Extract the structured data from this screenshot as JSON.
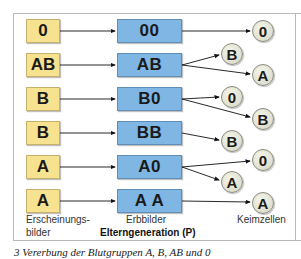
{
  "phenotypes": [
    "0",
    "AB",
    "B",
    "B",
    "A",
    "A"
  ],
  "genotypes": [
    "00",
    "AB",
    "B0",
    "BB",
    "A0",
    "A A"
  ],
  "gametes": [
    {
      "label": "0",
      "column": "right"
    },
    {
      "label": "B",
      "column": "left"
    },
    {
      "label": "A",
      "column": "right"
    },
    {
      "label": "0",
      "column": "left"
    },
    {
      "label": "B",
      "column": "right"
    },
    {
      "label": "B",
      "column": "left"
    },
    {
      "label": "0",
      "column": "right"
    },
    {
      "label": "A",
      "column": "left"
    },
    {
      "label": "A",
      "column": "right"
    }
  ],
  "labels": {
    "phenotype_line1": "Erscheinungs-",
    "phenotype_line2": "bilder",
    "genotype": "Erbbilder",
    "generation": "Elterngeneration (P)",
    "gametes": "Keimzellen"
  },
  "caption": "3 Vererbung der Blutgruppen A, B, AB und 0",
  "colors": {
    "phenotype_box": "#f7e38f",
    "genotype_box": "#7fb6e4",
    "gamete_circle": "#e6e6d8"
  }
}
